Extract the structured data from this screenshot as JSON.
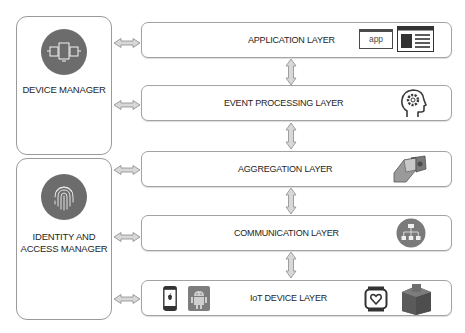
{
  "managers": [
    {
      "id": "device-manager",
      "label_lines": [
        "DEVICE MANAGER"
      ],
      "icon": "devices-icon"
    },
    {
      "id": "identity-access-manager",
      "label_lines": [
        "IDENTITY AND",
        "ACCESS MANAGER"
      ],
      "icon": "fingerprint-icon"
    }
  ],
  "layers": [
    {
      "id": "application",
      "label": "APPLICATION LAYER",
      "icons": [
        "app-window-icon",
        "web-page-icon"
      ],
      "app_icon_text": "app"
    },
    {
      "id": "event-processing",
      "label": "EVENT PROCESSING LAYER",
      "icons": [
        "head-gear-icon"
      ]
    },
    {
      "id": "aggregation",
      "label": "AGGREGATION LAYER",
      "icons": [
        "gateway-box-icon"
      ]
    },
    {
      "id": "communication",
      "label": "COMMUNICATION LAYER",
      "icons": [
        "network-hierarchy-icon"
      ]
    },
    {
      "id": "iot-device",
      "label": "IoT DEVICE LAYER",
      "icons": [
        "apple-phone-icon",
        "android-icon",
        "smartwatch-heart-icon",
        "package-box-icon"
      ]
    }
  ],
  "connections": {
    "vertical_between_layers": [
      [
        "APPLICATION LAYER",
        "EVENT PROCESSING LAYER"
      ],
      [
        "EVENT PROCESSING LAYER",
        "AGGREGATION LAYER"
      ],
      [
        "AGGREGATION LAYER",
        "COMMUNICATION LAYER"
      ],
      [
        "COMMUNICATION LAYER",
        "IoT DEVICE LAYER"
      ]
    ],
    "device_manager_to": [
      "APPLICATION LAYER",
      "EVENT PROCESSING LAYER"
    ],
    "identity_access_manager_to": [
      "AGGREGATION LAYER",
      "COMMUNICATION LAYER",
      "IoT DEVICE LAYER"
    ]
  },
  "colors": {
    "icon_dark": "#5f5f5f",
    "border": "#a3a3a3",
    "arrow_fill": "#d8d8d8",
    "arrow_stroke": "#8c8c8c"
  }
}
